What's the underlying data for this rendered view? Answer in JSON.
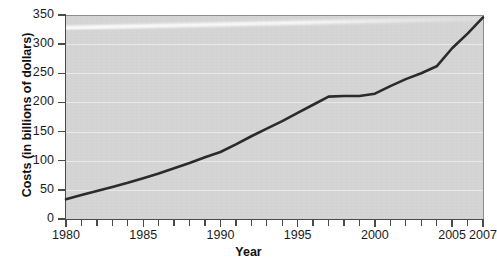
{
  "chart_data": {
    "type": "line",
    "title": "",
    "xlabel": "Year",
    "ylabel": "Costs (in billions of dollars)",
    "xlim": [
      1980,
      2007
    ],
    "ylim": [
      0,
      350
    ],
    "grid": true,
    "legend_position": "none",
    "x_tick_labels": [
      "1980",
      "1985",
      "1990",
      "1995",
      "2000",
      "2005",
      "2007"
    ],
    "x_tick_values": [
      1980,
      1985,
      1990,
      1995,
      2000,
      2005,
      2007
    ],
    "x_minor_ticks": [
      1981,
      1982,
      1983,
      1984,
      1986,
      1987,
      1988,
      1989,
      1991,
      1992,
      1993,
      1994,
      1996,
      1997,
      1998,
      1999,
      2001,
      2002,
      2003,
      2004,
      2006
    ],
    "y_tick_labels": [
      "0",
      "50",
      "100",
      "150",
      "200",
      "250",
      "300",
      "350"
    ],
    "y_tick_values": [
      0,
      50,
      100,
      150,
      200,
      250,
      300,
      350
    ],
    "series": [
      {
        "name": "Costs",
        "color": "#2b2b2b",
        "x": [
          1980,
          1981,
          1982,
          1983,
          1984,
          1985,
          1986,
          1987,
          1988,
          1989,
          1990,
          1991,
          1992,
          1993,
          1994,
          1995,
          1996,
          1997,
          1998,
          1999,
          2000,
          2001,
          2002,
          2003,
          2004,
          2005,
          2006,
          2007
        ],
        "values": [
          34,
          41,
          48,
          55,
          62,
          70,
          78,
          87,
          96,
          106,
          115,
          128,
          142,
          155,
          168,
          182,
          196,
          210,
          211,
          211,
          215,
          228,
          240,
          250,
          262,
          293,
          318,
          346
        ]
      }
    ]
  },
  "plot": {
    "background_color": "#d5d5d5",
    "gridline_color": "#e9e9e9",
    "axis_color": "#4a4a4a",
    "line_color": "#2b2b2b"
  }
}
